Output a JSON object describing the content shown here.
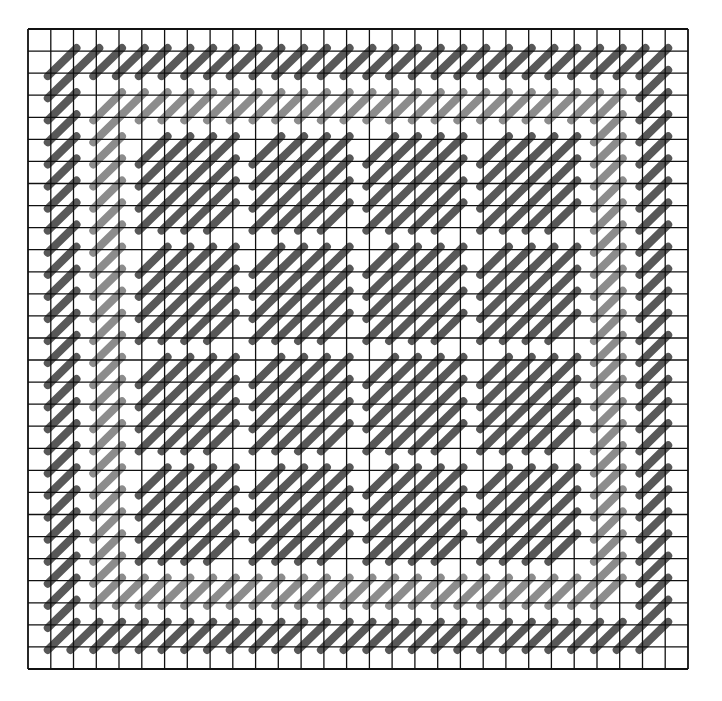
{
  "title": {
    "text": "",
    "note": "clipped at top edge; only glyph bottoms visible"
  },
  "board": {
    "columns": 29,
    "rows": 29,
    "origin_x": 28,
    "origin_y": 29,
    "width": 660,
    "height": 640,
    "grid_color": "#111111",
    "background": "#ffffff",
    "segment_orientation": "anti-diagonal (lower-left to upper-right of cell)",
    "colors": {
      "dark": "#585858",
      "light": "#8c8c8c"
    },
    "rings": [
      {
        "index": 1,
        "from": 1,
        "to": 27,
        "shade": "dark"
      },
      {
        "index": 3,
        "from": 3,
        "to": 25,
        "shade": "light"
      }
    ],
    "blocks": {
      "shade": "dark",
      "ranges": [
        [
          5,
          8
        ],
        [
          10,
          13
        ],
        [
          15,
          18
        ],
        [
          20,
          23
        ]
      ]
    }
  }
}
